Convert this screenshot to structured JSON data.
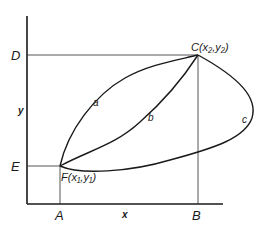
{
  "diagram": {
    "axes": {
      "x_label": "x",
      "y_label": "y"
    },
    "points": {
      "C": {
        "label": "C",
        "coords": "(x₂,y₂)",
        "display": "C(x₂,y₂)"
      },
      "F": {
        "label": "F",
        "coords": "(x₁,y₁)",
        "display": "F(x₁,y₁)"
      }
    },
    "guide_labels": {
      "D": "D",
      "E": "E",
      "A": "A",
      "B": "B"
    },
    "paths": [
      {
        "id": "a",
        "label": "a",
        "description": "upper concave path from F to C"
      },
      {
        "id": "b",
        "label": "b",
        "description": "middle path from F to C"
      },
      {
        "id": "c",
        "label": "c",
        "description": "lower loop path from F bulging right to C"
      }
    ]
  }
}
